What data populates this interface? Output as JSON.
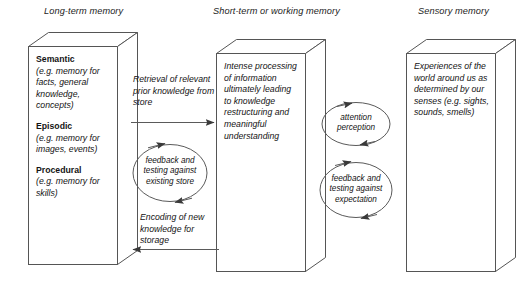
{
  "figure": {
    "background_color": "#ffffff",
    "stroke_color": "#4a4a4a",
    "text_color": "#141414"
  },
  "columns": [
    {
      "id": "long-term",
      "title": "Long-term memory"
    },
    {
      "id": "short-term",
      "title": "Short-term or working memory"
    },
    {
      "id": "sensory",
      "title": "Sensory memory"
    }
  ],
  "long_term_memory": {
    "entries": [
      {
        "heading": "Semantic",
        "description": "(e.g. memory for facts, general knowledge, concepts)"
      },
      {
        "heading": "Episodic",
        "description": "(e.g. memory for images, events)"
      },
      {
        "heading": "Procedural",
        "description": "(e.g. memory for skills)"
      }
    ]
  },
  "short_term_memory": {
    "body": "Intense processing of information ultimately leading to knowledge restructuring and meaningful understanding"
  },
  "sensory_memory": {
    "body": "Experiences of the world around us as determined by our senses (e.g. sights, sounds, smells)"
  },
  "connections": {
    "left_gap": {
      "top_arrow_label": "Retrieval of relevant prior knowledge from store",
      "loop_label": "feedback and testing against existing store",
      "bottom_arrow_label": "Encoding of new knowledge for storage"
    },
    "right_gap": {
      "top_loop_label": "attention perception",
      "bottom_loop_label": "feedback and testing against expectation"
    }
  }
}
